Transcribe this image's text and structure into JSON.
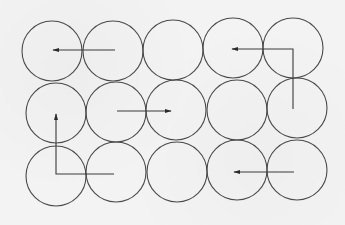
{
  "diagram": {
    "colors": {
      "background": "#f3f3f3",
      "stroke": "#4a4a4a",
      "arrow": "#3a3a3a"
    },
    "radius": 30,
    "rows": [
      {
        "row": 1,
        "circles": [
          {
            "cx": 52,
            "cy": 51
          },
          {
            "cx": 113,
            "cy": 51
          },
          {
            "cx": 173,
            "cy": 50
          },
          {
            "cx": 233,
            "cy": 48
          },
          {
            "cx": 293,
            "cy": 48
          }
        ]
      },
      {
        "row": 2,
        "circles": [
          {
            "cx": 56,
            "cy": 113
          },
          {
            "cx": 116,
            "cy": 112
          },
          {
            "cx": 176,
            "cy": 110
          },
          {
            "cx": 237,
            "cy": 110
          },
          {
            "cx": 297,
            "cy": 108
          }
        ]
      },
      {
        "row": 3,
        "circles": [
          {
            "cx": 56,
            "cy": 176
          },
          {
            "cx": 116,
            "cy": 172
          },
          {
            "cx": 177,
            "cy": 172
          },
          {
            "cx": 237,
            "cy": 170
          },
          {
            "cx": 297,
            "cy": 170
          }
        ]
      }
    ],
    "arrows": [
      {
        "id": "arrow-1",
        "direction": "left",
        "points": "115,50 53,50"
      },
      {
        "id": "arrow-2",
        "direction": "up-then-left",
        "points": "293,109 293,49 232,49"
      },
      {
        "id": "arrow-3",
        "direction": "right",
        "points": "117,111 171,111"
      },
      {
        "id": "arrow-4",
        "direction": "left-then-up",
        "points": "114,174 56,174 56,114"
      },
      {
        "id": "arrow-5",
        "direction": "left",
        "points": "294,172 234,172"
      }
    ]
  }
}
